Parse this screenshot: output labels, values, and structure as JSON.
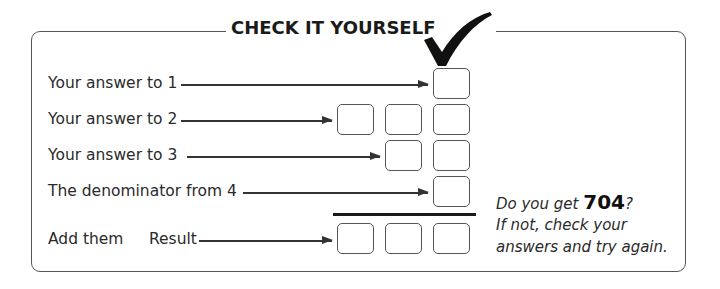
{
  "header": {
    "title": "CHECK IT YOURSELF",
    "icon": "checkmark-icon"
  },
  "rows": [
    {
      "label": "Your answer to 1",
      "boxes": 1
    },
    {
      "label": "Your answer to 2",
      "boxes": 3
    },
    {
      "label": "Your answer to 3",
      "boxes": 2
    },
    {
      "label": "The denominator from 4",
      "boxes": 1
    }
  ],
  "sum_row": {
    "label": "Add them",
    "result_label": "Result",
    "boxes": 3
  },
  "note": {
    "line1_prefix": "Do you get ",
    "target_value": "704",
    "line1_suffix": "?",
    "line2": "If not, check your",
    "line3": "answers and try again."
  }
}
